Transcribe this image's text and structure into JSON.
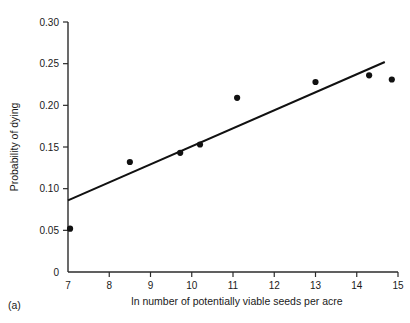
{
  "figure": {
    "panel_label": "(a)"
  },
  "chart_data": {
    "type": "scatter",
    "title": "",
    "subtitle": "",
    "xlabel": "ln number of potentially viable seeds per acre",
    "ylabel": "Probability of dying",
    "xlim": [
      7,
      15
    ],
    "ylim": [
      0,
      0.3
    ],
    "grid": false,
    "legend": null,
    "xticks": [
      7,
      8,
      9,
      10,
      11,
      12,
      13,
      14,
      15
    ],
    "xtick_labels": [
      "7",
      "8",
      "9",
      "10",
      "11",
      "12",
      "13",
      "14",
      "15"
    ],
    "yticks": [
      0,
      0.05,
      0.1,
      0.15,
      0.2,
      0.25,
      0.3
    ],
    "ytick_labels": [
      "0",
      "0.05",
      "0.10",
      "0.15",
      "0.20",
      "0.25",
      "0.30"
    ],
    "marker_color": "#111111",
    "line_color": "#111111",
    "axis_color": "#2b2b2b",
    "points": [
      {
        "x": 7.05,
        "y": 0.052
      },
      {
        "x": 8.5,
        "y": 0.132
      },
      {
        "x": 9.72,
        "y": 0.143
      },
      {
        "x": 10.2,
        "y": 0.153
      },
      {
        "x": 11.1,
        "y": 0.209
      },
      {
        "x": 13.0,
        "y": 0.228
      },
      {
        "x": 14.3,
        "y": 0.236
      },
      {
        "x": 14.85,
        "y": 0.231
      }
    ],
    "fit_line": {
      "name": "linear fit",
      "x_start": 7.0,
      "y_start": 0.086,
      "x_end": 14.68,
      "y_end": 0.252
    }
  }
}
